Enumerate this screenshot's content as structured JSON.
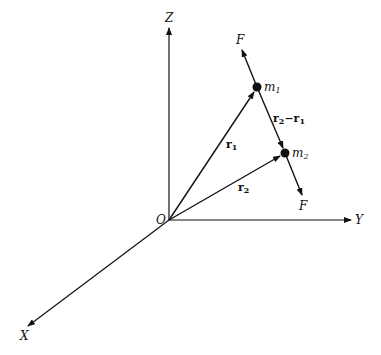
{
  "diagram": {
    "axes": {
      "z_label": "Z",
      "y_label": "Y",
      "x_label": "X",
      "origin_label": "O"
    },
    "masses": [
      {
        "label": "m",
        "sub": "1"
      },
      {
        "label": "m",
        "sub": "2"
      }
    ],
    "vectors": {
      "r1": {
        "label": "r",
        "sub": "1"
      },
      "r2": {
        "label": "r",
        "sub": "2"
      },
      "diff": {
        "label_a": "r",
        "sub_a": "2",
        "minus": "−",
        "label_b": "r",
        "sub_b": "1"
      }
    },
    "forces": {
      "upper": "F",
      "lower": "F"
    },
    "colors": {
      "stroke": "#111111",
      "background": "#ffffff"
    }
  }
}
